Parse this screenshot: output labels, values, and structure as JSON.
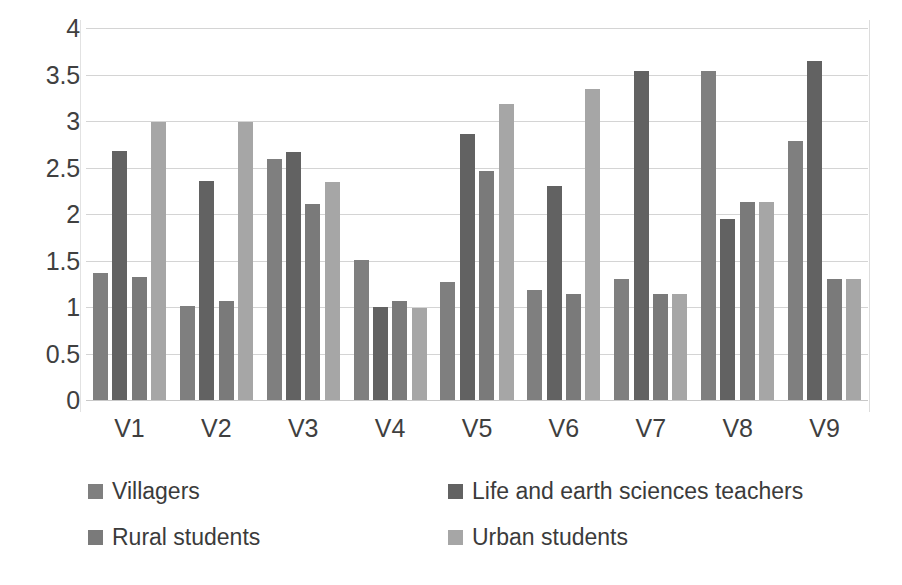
{
  "chart_data": {
    "type": "bar",
    "title": "",
    "subtitle": "",
    "xlabel": "",
    "ylabel": "",
    "ylim": [
      0,
      4
    ],
    "ytick_step": 0.5,
    "yticks": [
      "4",
      "3.5",
      "3",
      "2.5",
      "2",
      "1.5",
      "1",
      "0.5",
      "0"
    ],
    "ytick_values": [
      4,
      3.5,
      3,
      2.5,
      2,
      1.5,
      1,
      0.5,
      0
    ],
    "grid": true,
    "grid_axis": "y",
    "legend_position": "bottom",
    "legend_columns": 2,
    "categories": [
      "V1",
      "V2",
      "V3",
      "V4",
      "V5",
      "V6",
      "V7",
      "V8",
      "V9"
    ],
    "series": [
      {
        "name": "Villagers",
        "color": "#7f7f7f",
        "values": [
          1.37,
          1.01,
          2.59,
          1.51,
          1.27,
          1.18,
          1.3,
          3.54,
          2.78
        ]
      },
      {
        "name": "Life and earth sciences teachers",
        "color": "#626262",
        "values": [
          2.68,
          2.35,
          2.67,
          1.0,
          2.86,
          2.3,
          3.54,
          1.95,
          3.65
        ]
      },
      {
        "name": "Rural students",
        "color": "#7a7a7a",
        "values": [
          1.32,
          1.07,
          2.11,
          1.06,
          2.46,
          1.14,
          1.14,
          2.13,
          1.3
        ]
      },
      {
        "name": "Urban students",
        "color": "#a6a6a6",
        "values": [
          2.99,
          2.99,
          2.34,
          0.99,
          3.18,
          3.34,
          1.14,
          2.13,
          1.3
        ]
      }
    ]
  },
  "colors": {
    "background": "#ffffff",
    "gridline": "#d4d4d4",
    "axis": "#e2e2e2",
    "text": "#3a3a3a"
  }
}
